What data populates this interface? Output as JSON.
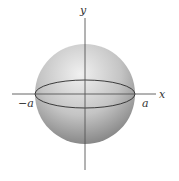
{
  "diagram": {
    "type": "sphere",
    "labels": {
      "y_axis": "y",
      "x_axis": "x",
      "neg_a": "−a",
      "pos_a": "a"
    },
    "colors": {
      "axis": "#555555",
      "sphere_light": "#e8e8e8",
      "sphere_dark": "#8a8a8a",
      "equator": "#2a2a2a"
    }
  }
}
